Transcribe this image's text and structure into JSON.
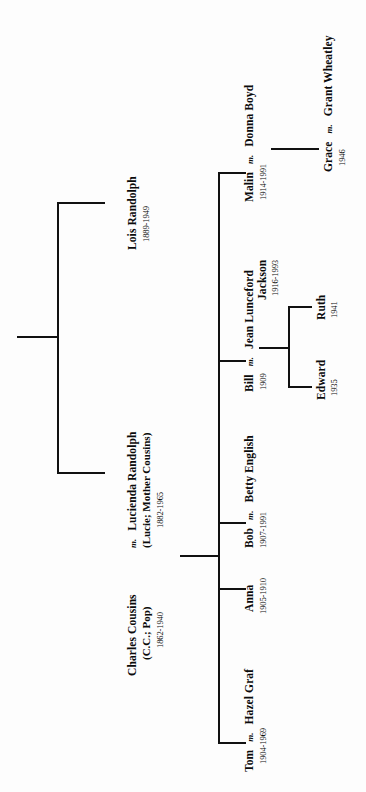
{
  "document": {
    "type": "genealogy-family-tree",
    "orientation": "rotated-90-counterclockwise",
    "marriage_symbol": "m."
  },
  "people": {
    "lois": {
      "name": "Lois Randolph",
      "dates": "1889-1949"
    },
    "lucienda": {
      "name": "Lucienda Randolph",
      "alias": "(Lucie; Mother Cousins)",
      "dates": "1882-1965"
    },
    "charles": {
      "name": "Charles Cousins",
      "alias": "(C.C.; Pop)",
      "dates": "1862-1940"
    },
    "tom": {
      "name": "Tom",
      "dates": "1904-1969"
    },
    "hazel": {
      "name": "Hazel Graf",
      "dates": ""
    },
    "anna": {
      "name": "Anna",
      "dates": "1905-1910"
    },
    "bob": {
      "name": "Bob",
      "dates": "1907-1991"
    },
    "betty": {
      "name": "Betty English",
      "dates": ""
    },
    "bill": {
      "name": "Bill",
      "dates": "1909"
    },
    "jean": {
      "name": "Jean Lunceford",
      "name2": "Jackson",
      "dates": "1916-1993"
    },
    "edward": {
      "name": "Edward",
      "dates": "1935"
    },
    "ruth": {
      "name": "Ruth",
      "dates": "1941"
    },
    "malin": {
      "name": "Malin",
      "dates": "1914-1991"
    },
    "donna": {
      "name": "Donna Boyd",
      "dates": ""
    },
    "grace": {
      "name": "Grace",
      "dates": "1946"
    },
    "grant": {
      "name": "Grant Wheatley",
      "dates": ""
    }
  },
  "marriages": {
    "charles_lucienda": "m.",
    "tom_hazel": "m.",
    "bob_betty": "m.",
    "bill_jean": "m.",
    "malin_donna": "m.",
    "grace_grant": "m."
  },
  "colors": {
    "ink": "#111111",
    "paper": "#fdfdfd"
  }
}
